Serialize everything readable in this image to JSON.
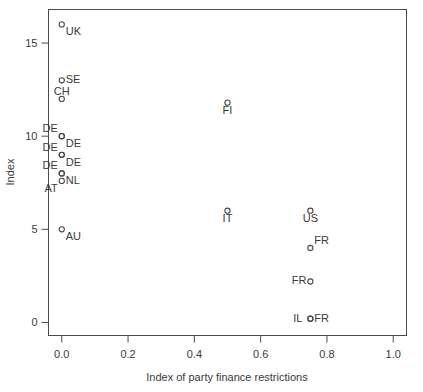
{
  "chart_data": {
    "type": "scatter",
    "title": "",
    "xlabel": "Index of party finance restrictions",
    "ylabel": "Index",
    "xlim": [
      -0.04,
      1.04
    ],
    "ylim": [
      -0.7,
      16.8
    ],
    "xticks": [
      "0.0",
      "0.2",
      "0.4",
      "0.6",
      "0.8",
      "1.0"
    ],
    "xtick_values": [
      0.0,
      0.2,
      0.4,
      0.6,
      0.8,
      1.0
    ],
    "yticks": [
      "0",
      "5",
      "10",
      "15"
    ],
    "ytick_values": [
      0,
      5,
      10,
      15
    ],
    "grid": false,
    "legend": "none",
    "marker": "open-circle",
    "points": [
      {
        "label": "UK",
        "x": 0.0,
        "y": 16.0,
        "lx": "right",
        "ly": "below"
      },
      {
        "label": "SE",
        "x": 0.0,
        "y": 13.0,
        "lx": "right",
        "ly": "middle"
      },
      {
        "label": "CH",
        "x": 0.0,
        "y": 12.0,
        "lx": "center",
        "ly": "above"
      },
      {
        "label": "FI",
        "x": 0.5,
        "y": 11.8,
        "lx": "center",
        "ly": "below"
      },
      {
        "label": "DE",
        "x": 0.0,
        "y": 10.0,
        "lx": "left",
        "ly": "above"
      },
      {
        "label": "DE",
        "x": 0.0,
        "y": 10.0,
        "lx": "right",
        "ly": "below"
      },
      {
        "label": "DE",
        "x": 0.0,
        "y": 9.0,
        "lx": "left",
        "ly": "above"
      },
      {
        "label": "DE",
        "x": 0.0,
        "y": 9.0,
        "lx": "right",
        "ly": "below"
      },
      {
        "label": "DE",
        "x": 0.0,
        "y": 8.0,
        "lx": "left",
        "ly": "above"
      },
      {
        "label": "NL",
        "x": 0.0,
        "y": 8.0,
        "lx": "right",
        "ly": "below"
      },
      {
        "label": "AT",
        "x": 0.0,
        "y": 7.6,
        "lx": "left",
        "ly": "below"
      },
      {
        "label": "IT",
        "x": 0.5,
        "y": 6.0,
        "lx": "center",
        "ly": "below"
      },
      {
        "label": "US",
        "x": 0.75,
        "y": 6.0,
        "lx": "center",
        "ly": "below"
      },
      {
        "label": "AU",
        "x": 0.0,
        "y": 5.0,
        "lx": "right",
        "ly": "below"
      },
      {
        "label": "FR",
        "x": 0.75,
        "y": 4.0,
        "lx": "right",
        "ly": "above"
      },
      {
        "label": "FR",
        "x": 0.75,
        "y": 2.2,
        "lx": "left",
        "ly": "middle"
      },
      {
        "label": "IL",
        "x": 0.75,
        "y": 0.2,
        "lx": "farleft",
        "ly": "middle"
      },
      {
        "label": "FR",
        "x": 0.75,
        "y": 0.2,
        "lx": "right",
        "ly": "middle"
      }
    ]
  }
}
